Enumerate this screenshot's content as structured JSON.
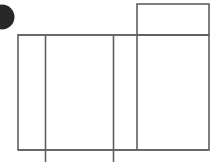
{
  "canvas": {
    "width": 222,
    "height": 162,
    "background_color": "#ffffff",
    "title": "Abstract line figure"
  },
  "style": {
    "stroke_color": "#5f6063",
    "stroke_color_light": "#7b7d80",
    "stroke_width": 1.6,
    "circle_fill": "#272727"
  },
  "shapes": {
    "corner_dot": {
      "name": "dark circle marker",
      "shape": "circle",
      "cx": 2,
      "cy": 17,
      "r": 12.5,
      "fill": "#272727",
      "clipped_edge": "left"
    },
    "main_rect": {
      "name": "large outer rectangle",
      "shape": "rect",
      "x": 18,
      "y": 35,
      "width": 191,
      "height": 115
    },
    "top_rect": {
      "name": "small upper-right rectangle",
      "shape": "rect",
      "x": 137,
      "y": 4,
      "width": 72,
      "height": 31
    },
    "divider_1": {
      "name": "first interior vertical divider",
      "shape": "line",
      "x1": 45.5,
      "y1": 35,
      "x2": 45.5,
      "y2": 162
    },
    "divider_2": {
      "name": "second interior vertical divider",
      "shape": "line",
      "x1": 113.5,
      "y1": 35,
      "x2": 113.5,
      "y2": 162
    },
    "divider_3": {
      "name": "third interior vertical divider",
      "shape": "line",
      "x1": 137,
      "y1": 35,
      "x2": 137,
      "y2": 150
    },
    "baseline": {
      "name": "bottom horizontal baseline",
      "shape": "line",
      "x1": 18,
      "y1": 150,
      "x2": 209,
      "y2": 150
    }
  },
  "labels": {
    "figure_caption": ""
  }
}
